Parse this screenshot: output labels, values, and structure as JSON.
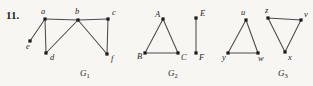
{
  "figure": {
    "problem_number": "11.",
    "background_color": "#f7f6f3",
    "edge_color": "#4a4a4a",
    "vertex_color": "#1a1a1a",
    "label_color": "#1f1f1f",
    "width": 313,
    "height": 86
  },
  "graphs": [
    {
      "id": "G1",
      "name": "G",
      "subscript": "1",
      "name_x": 80,
      "name_y": 76,
      "vertices": [
        {
          "id": "a",
          "label": "a",
          "x": 45,
          "y": 19,
          "label_x": 41,
          "label_y": 14
        },
        {
          "id": "b",
          "label": "b",
          "x": 78,
          "y": 20,
          "label_x": 75,
          "label_y": 14
        },
        {
          "id": "c",
          "label": "c",
          "x": 108,
          "y": 19,
          "label_x": 112,
          "label_y": 15
        },
        {
          "id": "e",
          "label": "e",
          "x": 30,
          "y": 41,
          "label_x": 26,
          "label_y": 49
        },
        {
          "id": "d",
          "label": "d",
          "x": 46,
          "y": 53,
          "label_x": 50,
          "label_y": 60
        },
        {
          "id": "f",
          "label": "f",
          "x": 107,
          "y": 54,
          "label_x": 111,
          "label_y": 61
        }
      ],
      "edges": [
        {
          "from": "a",
          "to": "e"
        },
        {
          "from": "a",
          "to": "b"
        },
        {
          "from": "a",
          "to": "d"
        },
        {
          "from": "b",
          "to": "d"
        },
        {
          "from": "b",
          "to": "c"
        },
        {
          "from": "b",
          "to": "f"
        },
        {
          "from": "c",
          "to": "f"
        }
      ]
    },
    {
      "id": "G2",
      "name": "G",
      "subscript": "2",
      "name_x": 168,
      "name_y": 76,
      "vertices": [
        {
          "id": "A",
          "label": "A",
          "x": 163,
          "y": 19,
          "label_x": 155,
          "label_y": 17
        },
        {
          "id": "B",
          "label": "B",
          "x": 145,
          "y": 53,
          "label_x": 137,
          "label_y": 59
        },
        {
          "id": "C",
          "label": "C",
          "x": 178,
          "y": 53,
          "label_x": 181,
          "label_y": 60
        },
        {
          "id": "E",
          "label": "E",
          "x": 196,
          "y": 18,
          "label_x": 200,
          "label_y": 16
        },
        {
          "id": "F",
          "label": "F",
          "x": 196,
          "y": 53,
          "label_x": 199,
          "label_y": 60
        }
      ],
      "edges": [
        {
          "from": "A",
          "to": "B"
        },
        {
          "from": "A",
          "to": "C"
        },
        {
          "from": "B",
          "to": "C"
        },
        {
          "from": "E",
          "to": "F"
        }
      ]
    },
    {
      "id": "G3",
      "name": "G",
      "subscript": "3",
      "name_x": 278,
      "name_y": 76,
      "vertices": [
        {
          "id": "u",
          "label": "u",
          "x": 246,
          "y": 20,
          "label_x": 241,
          "label_y": 15
        },
        {
          "id": "y",
          "label": "y",
          "x": 228,
          "y": 53,
          "label_x": 222,
          "label_y": 60
        },
        {
          "id": "w",
          "label": "w",
          "x": 258,
          "y": 53,
          "label_x": 258,
          "label_y": 61
        },
        {
          "id": "z",
          "label": "z",
          "x": 268,
          "y": 18,
          "label_x": 265,
          "label_y": 13
        },
        {
          "id": "v",
          "label": "v",
          "x": 301,
          "y": 20,
          "label_x": 304,
          "label_y": 17
        },
        {
          "id": "x",
          "label": "x",
          "x": 285,
          "y": 52,
          "label_x": 288,
          "label_y": 60
        }
      ],
      "edges": [
        {
          "from": "u",
          "to": "y"
        },
        {
          "from": "u",
          "to": "w"
        },
        {
          "from": "y",
          "to": "w"
        },
        {
          "from": "z",
          "to": "v"
        },
        {
          "from": "z",
          "to": "x"
        },
        {
          "from": "v",
          "to": "x"
        }
      ]
    }
  ]
}
